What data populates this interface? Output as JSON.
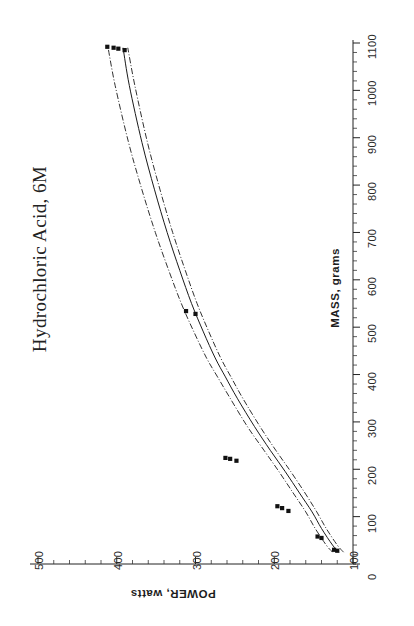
{
  "title": "Hydrochloric Acid, 6M",
  "axes": {
    "power_axis_title": "POWER, watts",
    "mass_axis_title": "MASS, grams"
  },
  "chart_data": {
    "type": "line",
    "title": "Hydrochloric Acid, 6M",
    "orientation": "transposed",
    "xlabel": "POWER, watts",
    "ylabel": "MASS, grams",
    "xlim": [
      500,
      100
    ],
    "ylim": [
      0,
      1100
    ],
    "xticks": [
      500,
      400,
      300,
      200,
      100
    ],
    "yticks": [
      0,
      100,
      200,
      300,
      400,
      500,
      600,
      700,
      800,
      900,
      1000,
      1100
    ],
    "x_axis_position": "bottom",
    "y_axis_position": "right",
    "x_axis_direction": "decreasing",
    "grid": false,
    "legend": null,
    "series": [
      {
        "name": "fit",
        "style": "solid",
        "x_power": [
          118,
          126,
          140,
          152,
          168,
          186,
          205,
          225,
          247,
          262,
          275,
          290,
          305,
          320,
          336,
          352,
          368,
          384,
          392
        ],
        "y_mass": [
          25,
          40,
          75,
          110,
          150,
          195,
          240,
          290,
          350,
          395,
          435,
          490,
          550,
          620,
          700,
          790,
          890,
          1010,
          1090
        ]
      },
      {
        "name": "upper confidence band",
        "style": "dash-dot",
        "x_power": [
          112,
          120,
          134,
          146,
          161,
          179,
          198,
          218,
          240,
          255,
          268,
          283,
          298,
          313,
          329,
          345,
          361,
          377,
          386
        ],
        "y_mass": [
          25,
          40,
          75,
          110,
          150,
          195,
          240,
          290,
          350,
          395,
          435,
          490,
          550,
          620,
          700,
          790,
          890,
          1010,
          1090
        ]
      },
      {
        "name": "lower confidence band",
        "style": "dash-dot",
        "x_power": [
          126,
          134,
          148,
          160,
          176,
          194,
          213,
          234,
          256,
          272,
          286,
          302,
          318,
          334,
          351,
          368,
          385,
          402,
          411
        ],
        "y_mass": [
          25,
          40,
          75,
          110,
          150,
          195,
          240,
          290,
          350,
          395,
          435,
          490,
          550,
          620,
          700,
          790,
          890,
          1010,
          1090
        ]
      }
    ],
    "data_points": {
      "marker": "filled-square",
      "power_watts": [
        120,
        124,
        140,
        145,
        182,
        190,
        196,
        248,
        256,
        262,
        300,
        312,
        390,
        398,
        404,
        412
      ],
      "mass_grams": [
        28,
        30,
        55,
        58,
        112,
        118,
        122,
        218,
        222,
        224,
        528,
        534,
        1085,
        1088,
        1090,
        1092
      ]
    }
  }
}
